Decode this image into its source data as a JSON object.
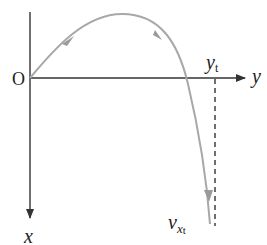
{
  "diagram": {
    "origin_label": "O",
    "horizontal_axis": {
      "label": "y",
      "direction": "right"
    },
    "vertical_axis": {
      "label": "x",
      "direction": "down"
    },
    "marker": {
      "label_main": "y",
      "label_sub": "t",
      "style": "dashed vertical line"
    },
    "curve_end_label": {
      "main": "v",
      "sub_main": "x",
      "sub_sub": "t"
    },
    "curve": {
      "description": "trajectory rising from origin to a peak, then falling steeply past the y-axis toward v_xt",
      "arrows": 3
    },
    "colors": {
      "axes": "#333333",
      "curve": "#a8a8a8",
      "text": "#222222"
    }
  }
}
